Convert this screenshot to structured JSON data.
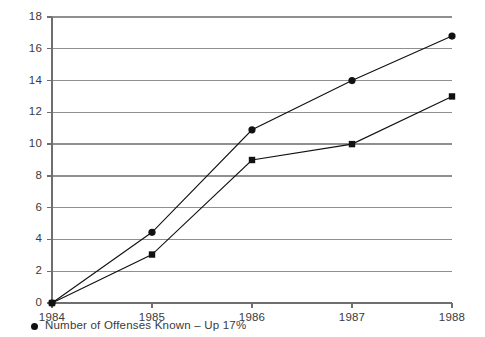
{
  "chart_data": {
    "type": "line",
    "title": "",
    "subtitle": "",
    "xlabel": "",
    "ylabel": "",
    "x": [
      "1984",
      "1985",
      "1986",
      "1987",
      "1988"
    ],
    "categories": [
      "1984",
      "1985",
      "1986",
      "1987",
      "1988"
    ],
    "xlim": [
      "1984",
      "1988"
    ],
    "ylim": [
      0,
      18
    ],
    "y_ticks": [
      0,
      2,
      4,
      6,
      8,
      10,
      12,
      14,
      16,
      18
    ],
    "y_tick_labels": [
      "0",
      "2",
      "4",
      "6",
      "8",
      "10",
      "12",
      "14",
      "16",
      "18"
    ],
    "x_tick_labels": [
      "1984",
      "1985",
      "1986",
      "1987",
      "1988"
    ],
    "grid": "horizontal",
    "legend_position": "below-left",
    "series": [
      {
        "name": "Number of Offenses Known – Up 17%",
        "marker": "circle",
        "color": "#111111",
        "values": [
          0,
          4.45,
          10.9,
          14.0,
          16.8
        ]
      },
      {
        "name": "",
        "marker": "square",
        "color": "#111111",
        "values": [
          0,
          3.05,
          9.0,
          10.0,
          13.0
        ]
      }
    ],
    "annotations": []
  },
  "legend": {
    "entries": [
      {
        "marker": "circle-marker",
        "label": "Number of Offenses Known – Up 17%"
      }
    ]
  },
  "colors": {
    "background": "#ffffff",
    "gridline": "#8f8f8f",
    "axis": "#6f6f6f",
    "series": "#111111",
    "text": "#3a3a3a"
  }
}
